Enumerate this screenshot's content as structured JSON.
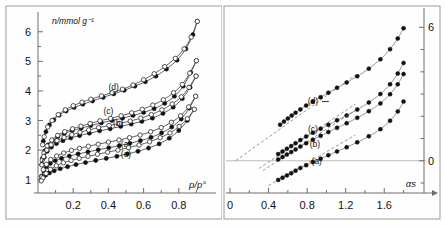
{
  "figure": {
    "background": "#fefefe",
    "panels": [
      "left-isotherm-panel",
      "right-alpha-s-panel"
    ]
  },
  "chart_data": [
    {
      "type": "scatter",
      "id": "isotherm-panel",
      "title": "",
      "xlabel": "p/p°",
      "ylabel": "n/mmol g⁻¹",
      "xlim": [
        0,
        1.0
      ],
      "ylim": [
        0.55,
        6.6
      ],
      "xticks": [
        0.2,
        0.4,
        0.6,
        0.8
      ],
      "xticklabels": [
        "0.2",
        "0.4",
        "0.6",
        "0.8"
      ],
      "yticks": [
        1,
        2,
        3,
        4,
        5,
        6
      ],
      "yticklabels": [
        "1",
        "2",
        "3",
        "4",
        "5",
        "6"
      ],
      "grid": false,
      "legend": "inline-curve-labels",
      "markers": {
        "adsorption": "filled-circle",
        "desorption": "open-circle"
      },
      "series": [
        {
          "name": "(d)",
          "label": "(d)",
          "label_x": 0.43,
          "label_y": 4.02,
          "adsorption": {
            "x": [
              0.03,
              0.045,
              0.065,
              0.09,
              0.12,
              0.16,
              0.205,
              0.255,
              0.31,
              0.37,
              0.43,
              0.49,
              0.55,
              0.61,
              0.67,
              0.73,
              0.79,
              0.84,
              0.88,
              0.905
            ],
            "y": [
              2.3,
              2.62,
              2.85,
              3.02,
              3.18,
              3.32,
              3.44,
              3.55,
              3.66,
              3.78,
              3.9,
              4.02,
              4.16,
              4.31,
              4.5,
              4.74,
              5.04,
              5.42,
              5.9,
              6.35
            ]
          },
          "desorption": {
            "x": [
              0.905,
              0.87,
              0.83,
              0.78,
              0.72,
              0.66,
              0.6,
              0.54,
              0.48,
              0.42,
              0.36,
              0.3,
              0.25,
              0.2,
              0.155,
              0.115,
              0.08,
              0.055,
              0.035,
              0.026
            ],
            "y": [
              6.35,
              5.82,
              5.42,
              5.1,
              4.82,
              4.58,
              4.38,
              4.2,
              4.06,
              3.94,
              3.83,
              3.72,
              3.62,
              3.5,
              3.36,
              3.2,
              3.0,
              2.78,
              2.45,
              2.18
            ]
          }
        },
        {
          "name": "(c)",
          "label": "(c)",
          "label_x": 0.4,
          "label_y": 3.22,
          "adsorption": {
            "x": [
              0.025,
              0.04,
              0.058,
              0.082,
              0.112,
              0.15,
              0.195,
              0.245,
              0.3,
              0.36,
              0.42,
              0.48,
              0.54,
              0.6,
              0.66,
              0.72,
              0.775,
              0.825,
              0.868,
              0.9
            ],
            "y": [
              1.72,
              1.98,
              2.18,
              2.33,
              2.45,
              2.56,
              2.66,
              2.74,
              2.83,
              2.92,
              3.0,
              3.08,
              3.17,
              3.27,
              3.4,
              3.58,
              3.82,
              4.16,
              4.62,
              5.02
            ]
          },
          "desorption": {
            "x": [
              0.9,
              0.862,
              0.82,
              0.77,
              0.712,
              0.652,
              0.592,
              0.532,
              0.472,
              0.412,
              0.352,
              0.296,
              0.244,
              0.196,
              0.152,
              0.112,
              0.078,
              0.052,
              0.034,
              0.024
            ],
            "y": [
              5.02,
              4.6,
              4.22,
              3.94,
              3.7,
              3.52,
              3.38,
              3.26,
              3.16,
              3.07,
              2.99,
              2.9,
              2.81,
              2.72,
              2.62,
              2.5,
              2.34,
              2.14,
              1.9,
              1.66
            ]
          }
        },
        {
          "name": "(b)",
          "label": "(b)",
          "label_x": 0.455,
          "label_y": 2.8,
          "adsorption": {
            "x": [
              0.022,
              0.036,
              0.053,
              0.076,
              0.105,
              0.142,
              0.186,
              0.236,
              0.292,
              0.35,
              0.41,
              0.47,
              0.53,
              0.59,
              0.65,
              0.71,
              0.768,
              0.82,
              0.864,
              0.898
            ],
            "y": [
              1.52,
              1.76,
              1.96,
              2.1,
              2.22,
              2.32,
              2.41,
              2.49,
              2.57,
              2.65,
              2.72,
              2.8,
              2.88,
              2.97,
              3.08,
              3.24,
              3.45,
              3.74,
              4.12,
              4.5
            ]
          },
          "desorption": {
            "x": [
              0.898,
              0.858,
              0.814,
              0.762,
              0.704,
              0.644,
              0.584,
              0.524,
              0.464,
              0.404,
              0.344,
              0.288,
              0.238,
              0.192,
              0.148,
              0.108,
              0.074,
              0.05,
              0.032,
              0.022
            ],
            "y": [
              4.5,
              4.12,
              3.8,
              3.56,
              3.36,
              3.2,
              3.08,
              2.98,
              2.9,
              2.83,
              2.76,
              2.68,
              2.6,
              2.52,
              2.43,
              2.32,
              2.18,
              2.0,
              1.78,
              1.5
            ]
          }
        },
        {
          "name": "(a)",
          "label": "(a)",
          "label_x": 0.5,
          "label_y": 2.1,
          "adsorption": {
            "x": [
              0.02,
              0.033,
              0.049,
              0.07,
              0.098,
              0.134,
              0.178,
              0.228,
              0.284,
              0.342,
              0.402,
              0.462,
              0.522,
              0.582,
              0.642,
              0.702,
              0.76,
              0.814,
              0.86,
              0.896
            ],
            "y": [
              1.12,
              1.3,
              1.44,
              1.55,
              1.64,
              1.72,
              1.8,
              1.87,
              1.94,
              2.01,
              2.08,
              2.15,
              2.23,
              2.32,
              2.43,
              2.58,
              2.78,
              3.05,
              3.42,
              3.82
            ]
          },
          "desorption": {
            "x": [
              0.896,
              0.856,
              0.81,
              0.758,
              0.7,
              0.64,
              0.58,
              0.52,
              0.46,
              0.4,
              0.342,
              0.286,
              0.236,
              0.19,
              0.146,
              0.106,
              0.072,
              0.048,
              0.03,
              0.02
            ],
            "y": [
              3.82,
              3.46,
              3.16,
              2.94,
              2.76,
              2.62,
              2.51,
              2.42,
              2.34,
              2.27,
              2.2,
              2.13,
              2.06,
              1.99,
              1.9,
              1.8,
              1.68,
              1.52,
              1.34,
              1.1
            ]
          }
        },
        {
          "name": "(e)",
          "label": "(e)",
          "label_x": 0.5,
          "label_y": 1.76,
          "adsorption": {
            "x": [
              0.018,
              0.03,
              0.045,
              0.065,
              0.092,
              0.126,
              0.168,
              0.216,
              0.27,
              0.328,
              0.388,
              0.448,
              0.508,
              0.568,
              0.628,
              0.688,
              0.746,
              0.8,
              0.848,
              0.888
            ],
            "y": [
              0.98,
              1.08,
              1.16,
              1.23,
              1.3,
              1.37,
              1.44,
              1.51,
              1.58,
              1.65,
              1.72,
              1.79,
              1.87,
              1.96,
              2.07,
              2.21,
              2.4,
              2.66,
              3.0,
              3.38
            ]
          },
          "desorption": {
            "x": [
              0.888,
              0.848,
              0.802,
              0.75,
              0.694,
              0.634,
              0.574,
              0.514,
              0.454,
              0.396,
              0.338,
              0.284,
              0.234,
              0.188,
              0.144,
              0.104,
              0.07,
              0.046,
              0.028,
              0.018
            ],
            "y": [
              3.38,
              3.06,
              2.8,
              2.58,
              2.42,
              2.28,
              2.17,
              2.08,
              2.0,
              1.93,
              1.86,
              1.79,
              1.72,
              1.65,
              1.57,
              1.47,
              1.35,
              1.21,
              1.06,
              0.96
            ]
          }
        }
      ]
    },
    {
      "type": "scatter",
      "id": "alpha-s-panel",
      "title": "",
      "xlabel": "αs",
      "ylabel": "",
      "xlim": [
        0,
        1.95
      ],
      "ylim": [
        -1.45,
        6.6
      ],
      "xticks": [
        0,
        0.4,
        0.8,
        1.2,
        1.6
      ],
      "xticklabels": [
        "0",
        "0.4",
        "0.8",
        "1.2",
        "1.6"
      ],
      "yticks": [
        0,
        6
      ],
      "yticklabels": [
        "0",
        "6"
      ],
      "y_axis_position": "right",
      "grid": false,
      "legend": "inline-curve-labels",
      "markers": {
        "points": "filled-circle"
      },
      "reference_line_y": 0,
      "series": [
        {
          "name": "(d)",
          "label": "(d)",
          "label_x": 0.86,
          "label_y": 2.55,
          "x": [
            0.52,
            0.56,
            0.6,
            0.64,
            0.68,
            0.73,
            0.79,
            0.86,
            0.94,
            1.02,
            1.11,
            1.21,
            1.32,
            1.44,
            1.56,
            1.66,
            1.74,
            1.8
          ],
          "y": [
            1.62,
            1.76,
            1.9,
            2.03,
            2.16,
            2.31,
            2.48,
            2.66,
            2.86,
            3.06,
            3.28,
            3.52,
            3.8,
            4.14,
            4.56,
            5.02,
            5.5,
            5.96
          ],
          "fit_intercept": -0.18,
          "fit_slope": 3.1,
          "fit_x_range": [
            0.06,
            1.3
          ]
        },
        {
          "name": "(c)",
          "label": "(c)",
          "label_x": 0.86,
          "label_y": 1.3,
          "x": [
            0.5,
            0.545,
            0.59,
            0.635,
            0.68,
            0.73,
            0.79,
            0.86,
            0.94,
            1.02,
            1.11,
            1.21,
            1.32,
            1.44,
            1.56,
            1.66,
            1.74,
            1.8
          ],
          "y": [
            0.3,
            0.42,
            0.54,
            0.66,
            0.79,
            0.93,
            1.09,
            1.26,
            1.44,
            1.62,
            1.82,
            2.04,
            2.3,
            2.62,
            3.0,
            3.44,
            3.92,
            4.4
          ],
          "fit_intercept": -1.22,
          "fit_slope": 2.9,
          "fit_x_range": [
            0.3,
            1.3
          ]
        },
        {
          "name": "(b)",
          "label": "(b)",
          "label_x": 0.88,
          "label_y": 0.62,
          "x": [
            0.5,
            0.545,
            0.59,
            0.635,
            0.68,
            0.73,
            0.79,
            0.86,
            0.94,
            1.02,
            1.11,
            1.21,
            1.32,
            1.44,
            1.56,
            1.66,
            1.74,
            1.8
          ],
          "y": [
            0.06,
            0.17,
            0.28,
            0.39,
            0.51,
            0.64,
            0.79,
            0.95,
            1.12,
            1.29,
            1.48,
            1.69,
            1.93,
            2.23,
            2.58,
            2.99,
            3.44,
            3.9
          ],
          "fit_intercept": -1.4,
          "fit_slope": 2.82,
          "fit_x_range": [
            0.34,
            1.3
          ]
        },
        {
          "name": "(a)",
          "label": "(a)",
          "label_x": 0.9,
          "label_y": -0.16,
          "x": [
            0.5,
            0.545,
            0.59,
            0.635,
            0.68,
            0.73,
            0.79,
            0.86,
            0.94,
            1.02,
            1.11,
            1.21,
            1.32,
            1.44,
            1.56,
            1.66,
            1.74,
            1.8
          ],
          "y": [
            -0.86,
            -0.76,
            -0.66,
            -0.56,
            -0.45,
            -0.33,
            -0.2,
            -0.06,
            0.09,
            0.25,
            0.42,
            0.61,
            0.83,
            1.1,
            1.42,
            1.8,
            2.22,
            2.66
          ],
          "fit_intercept": -2.12,
          "fit_slope": 2.52,
          "fit_x_range": [
            0.4,
            1.3
          ]
        }
      ]
    }
  ]
}
